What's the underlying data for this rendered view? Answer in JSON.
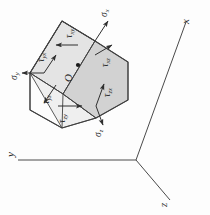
{
  "figure": {
    "caption": "Fig. 2.45",
    "type": "stress-element-diagram",
    "rotation_deg": -90,
    "background_color": "#fdfdfd",
    "line_color": "#3a3a3a"
  },
  "axes": {
    "origin_label": "",
    "items": [
      {
        "name": "x-axis",
        "label": "x"
      },
      {
        "name": "y-axis",
        "label": "y"
      },
      {
        "name": "z-axis",
        "label": "z"
      }
    ]
  },
  "element": {
    "center_label": "O",
    "faces": {
      "top_fill": "#d9d9d9",
      "front_fill": "#ebebeb",
      "right_fill": "#cfcfcf",
      "edge_color": "#4a4a4a"
    },
    "normal_stresses": [
      {
        "name": "sigma-x",
        "label": "σ",
        "sub": "x"
      },
      {
        "name": "sigma-y",
        "label": "σ",
        "sub": "y"
      },
      {
        "name": "sigma-z",
        "label": "σ",
        "sub": "z"
      }
    ],
    "shear_stresses": [
      {
        "name": "tau-xy",
        "label": "τ",
        "sub": "xy"
      },
      {
        "name": "tau-yx",
        "label": "τ",
        "sub": "yx"
      },
      {
        "name": "tau-xz",
        "label": "τ",
        "sub": "xz"
      },
      {
        "name": "tau-zx",
        "label": "τ",
        "sub": "zx"
      },
      {
        "name": "tau-yz",
        "label": "τ",
        "sub": "yz"
      },
      {
        "name": "tau-zy",
        "label": "τ",
        "sub": "zy"
      }
    ]
  }
}
